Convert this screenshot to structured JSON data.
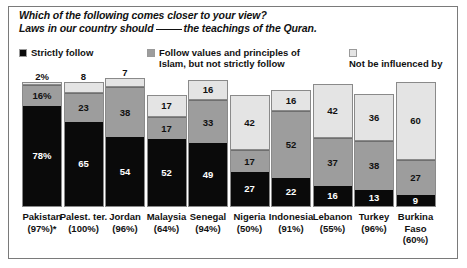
{
  "title": {
    "line1": "Which of the following comes closer to your view?",
    "line2_before": "Laws in our country should",
    "line2_blank": "____",
    "line2_after": "the teachings of the Quran."
  },
  "legend": {
    "items": [
      {
        "label": "Strictly follow",
        "color": "#0a0a0a",
        "key": "strictly_follow"
      },
      {
        "label": "Follow values and principles of Islam, but not strictly follow",
        "color": "#9d9d9d",
        "key": "values_not_strict"
      },
      {
        "label": "Not be influenced by",
        "color": "#e4e4e4",
        "key": "not_influenced"
      }
    ]
  },
  "chart_data": {
    "type": "bar",
    "subtype": "stacked-100",
    "xlabel": "",
    "ylabel": "",
    "ylim": [
      0,
      100
    ],
    "grid": false,
    "legend_position": "top",
    "categories": [
      "Pakistan",
      "Palest. ter.",
      "Jordan",
      "Malaysia",
      "Senegal",
      "Nigeria",
      "Indonesia",
      "Lebanon",
      "Turkey",
      "Burkina Faso"
    ],
    "category_sublabels": [
      "(97%)*",
      "(100%)",
      "(96%)",
      "(64%)",
      "(94%)",
      "(50%)",
      "(91%)",
      "(55%)",
      "(96%)",
      "(60%)"
    ],
    "series": [
      {
        "name": "Strictly follow",
        "color": "#0a0a0a",
        "values": [
          78,
          65,
          54,
          52,
          49,
          27,
          22,
          16,
          13,
          9
        ]
      },
      {
        "name": "Follow values and principles of Islam, but not strictly follow",
        "color": "#9d9d9d",
        "values": [
          16,
          23,
          38,
          17,
          33,
          17,
          52,
          37,
          38,
          27
        ]
      },
      {
        "name": "Not be influenced by",
        "color": "#e4e4e4",
        "values": [
          2,
          8,
          7,
          17,
          16,
          42,
          16,
          42,
          36,
          60
        ]
      }
    ],
    "value_labels": {
      "Pakistan": {
        "strictly_follow": "78%",
        "values_not_strict": "16%",
        "not_influenced": "2%"
      },
      "Palest. ter.": {
        "strictly_follow": "65",
        "values_not_strict": "23",
        "not_influenced": "8"
      },
      "Jordan": {
        "strictly_follow": "54",
        "values_not_strict": "38",
        "not_influenced": "7"
      },
      "Malaysia": {
        "strictly_follow": "52",
        "values_not_strict": "17",
        "not_influenced": "17"
      },
      "Senegal": {
        "strictly_follow": "49",
        "values_not_strict": "33",
        "not_influenced": "16"
      },
      "Nigeria": {
        "strictly_follow": "27",
        "values_not_strict": "17",
        "not_influenced": "42"
      },
      "Indonesia": {
        "strictly_follow": "22",
        "values_not_strict": "52",
        "not_influenced": "16"
      },
      "Lebanon": {
        "strictly_follow": "16",
        "values_not_strict": "37",
        "not_influenced": "42"
      },
      "Turkey": {
        "strictly_follow": "13",
        "values_not_strict": "38",
        "not_influenced": "36"
      },
      "Burkina Faso": {
        "strictly_follow": "9",
        "values_not_strict": "27",
        "not_influenced": "60"
      }
    }
  },
  "bars": [
    {
      "name": "Pakistan",
      "label_line1": "Pakistan",
      "label_line2": "(97%)*",
      "strict": {
        "value": 78,
        "text": "78%"
      },
      "values": {
        "value": 16,
        "text": "16%"
      },
      "notinf": {
        "value": 2,
        "text": "2%"
      }
    },
    {
      "name": "Palest. ter.",
      "label_line1": "Palest. ter.",
      "label_line2": "(100%)",
      "strict": {
        "value": 65,
        "text": "65"
      },
      "values": {
        "value": 23,
        "text": "23"
      },
      "notinf": {
        "value": 8,
        "text": "8"
      }
    },
    {
      "name": "Jordan",
      "label_line1": "Jordan",
      "label_line2": "(96%)",
      "strict": {
        "value": 54,
        "text": "54"
      },
      "values": {
        "value": 38,
        "text": "38"
      },
      "notinf": {
        "value": 7,
        "text": "7"
      }
    },
    {
      "name": "Malaysia",
      "label_line1": "Malaysia",
      "label_line2": "(64%)",
      "strict": {
        "value": 52,
        "text": "52"
      },
      "values": {
        "value": 17,
        "text": "17"
      },
      "notinf": {
        "value": 17,
        "text": "17"
      }
    },
    {
      "name": "Senegal",
      "label_line1": "Senegal",
      "label_line2": "(94%)",
      "strict": {
        "value": 49,
        "text": "49"
      },
      "values": {
        "value": 33,
        "text": "33"
      },
      "notinf": {
        "value": 16,
        "text": "16"
      }
    },
    {
      "name": "Nigeria",
      "label_line1": "Nigeria",
      "label_line2": "(50%)",
      "strict": {
        "value": 27,
        "text": "27"
      },
      "values": {
        "value": 17,
        "text": "17"
      },
      "notinf": {
        "value": 42,
        "text": "42"
      }
    },
    {
      "name": "Indonesia",
      "label_line1": "Indonesia",
      "label_line2": "(91%)",
      "strict": {
        "value": 22,
        "text": "22"
      },
      "values": {
        "value": 52,
        "text": "52"
      },
      "notinf": {
        "value": 16,
        "text": "16"
      }
    },
    {
      "name": "Lebanon",
      "label_line1": "Lebanon",
      "label_line2": "(55%)",
      "strict": {
        "value": 16,
        "text": "16"
      },
      "values": {
        "value": 37,
        "text": "37"
      },
      "notinf": {
        "value": 42,
        "text": "42"
      }
    },
    {
      "name": "Turkey",
      "label_line1": "Turkey",
      "label_line2": "(96%)",
      "strict": {
        "value": 13,
        "text": "13"
      },
      "values": {
        "value": 38,
        "text": "38"
      },
      "notinf": {
        "value": 36,
        "text": "36"
      }
    },
    {
      "name": "Burkina Faso",
      "label_line1": "Burkina",
      "label_line1b": "Faso",
      "label_line2": "(60%)",
      "strict": {
        "value": 9,
        "text": "9"
      },
      "values": {
        "value": 27,
        "text": "27"
      },
      "notinf": {
        "value": 60,
        "text": "60"
      }
    }
  ],
  "colors": {
    "strictly_follow": "#0a0a0a",
    "values_not_strict": "#9d9d9d",
    "not_influenced": "#e4e4e4",
    "frame": "#7a7a7a",
    "text": "#111111"
  }
}
